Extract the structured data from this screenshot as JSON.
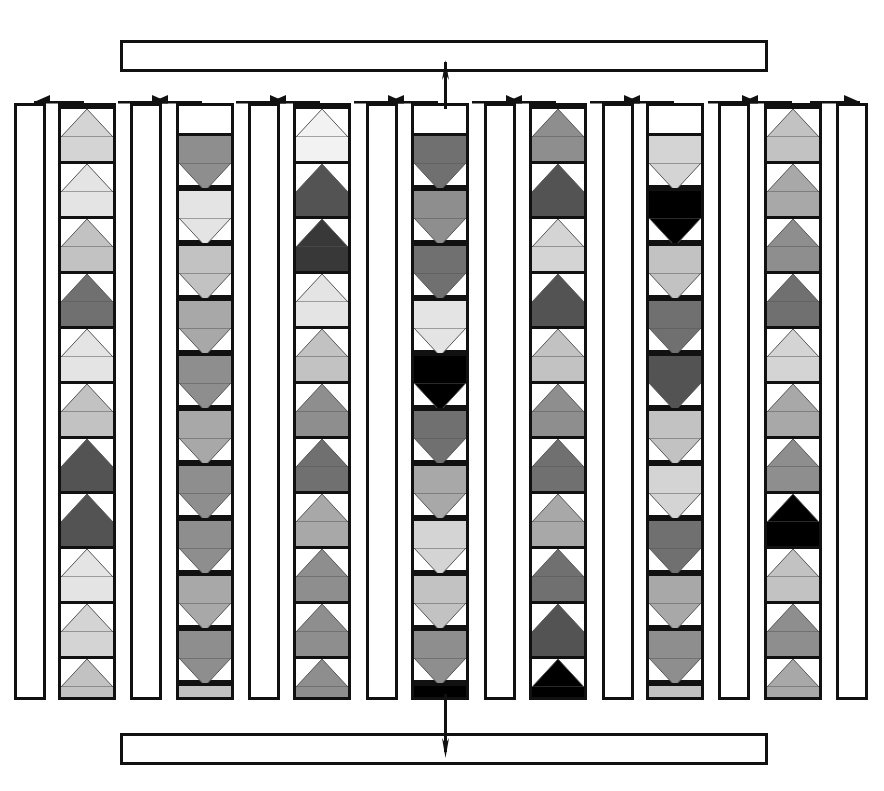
{
  "diagram": {
    "canvas": {
      "width": 884,
      "height": 791
    },
    "colors": {
      "stroke": "#111111",
      "background": "#ffffff",
      "grays": {
        "g1": "#f2f2f2",
        "g2": "#e4e4e4",
        "g3": "#d4d4d4",
        "g4": "#c2c2c2",
        "g5": "#a8a8a8",
        "g6": "#8e8e8e",
        "g7": "#707070",
        "g8": "#535353",
        "g9": "#383838",
        "g10": "#000000"
      }
    },
    "top_bus": {
      "label": "",
      "x": 120,
      "y": 40,
      "width": 648,
      "height": 32
    },
    "bottom_bus": {
      "label": "",
      "x": 120,
      "y": 733,
      "width": 648,
      "height": 32
    },
    "center_trunk": {
      "x": 444,
      "top_y": 62,
      "bottom_y": 752,
      "up_arrow": true,
      "down_arrow": true
    },
    "arrow_row": {
      "y": 92,
      "arrows": [
        {
          "x": 34,
          "width": 50,
          "direction": "left"
        },
        {
          "x": 118,
          "width": 50,
          "direction": "right"
        },
        {
          "x": 152,
          "width": 50,
          "direction": "left"
        },
        {
          "x": 236,
          "width": 50,
          "direction": "right"
        },
        {
          "x": 270,
          "width": 50,
          "direction": "left"
        },
        {
          "x": 354,
          "width": 50,
          "direction": "right"
        },
        {
          "x": 388,
          "width": 50,
          "direction": "left"
        },
        {
          "x": 472,
          "width": 50,
          "direction": "right"
        },
        {
          "x": 506,
          "width": 50,
          "direction": "left"
        },
        {
          "x": 590,
          "width": 50,
          "direction": "right"
        },
        {
          "x": 624,
          "width": 50,
          "direction": "left"
        },
        {
          "x": 708,
          "width": 50,
          "direction": "right"
        },
        {
          "x": 742,
          "width": 50,
          "direction": "left"
        },
        {
          "x": 810,
          "width": 50,
          "direction": "right"
        }
      ]
    },
    "spacer_columns": [
      {
        "index": 0,
        "x": 14,
        "y": 103,
        "width": 32,
        "height": 597
      },
      {
        "index": 1,
        "x": 130,
        "y": 103,
        "width": 32,
        "height": 597
      },
      {
        "index": 2,
        "x": 248,
        "y": 103,
        "width": 32,
        "height": 597
      },
      {
        "index": 3,
        "x": 366,
        "y": 103,
        "width": 32,
        "height": 597
      },
      {
        "index": 4,
        "x": 484,
        "y": 103,
        "width": 32,
        "height": 597
      },
      {
        "index": 5,
        "x": 602,
        "y": 103,
        "width": 32,
        "height": 597
      },
      {
        "index": 6,
        "x": 718,
        "y": 103,
        "width": 32,
        "height": 597
      },
      {
        "index": 7,
        "x": 836,
        "y": 103,
        "width": 32,
        "height": 597
      }
    ],
    "data_columns": [
      {
        "index": 0,
        "x": 58,
        "y": 103,
        "width": 58,
        "height": 597,
        "orientation": "up",
        "offset": 0,
        "cells": [
          "g3",
          "g2",
          "g4",
          "g7",
          "g2",
          "g4",
          "g8",
          "g8",
          "g2",
          "g3",
          "g4"
        ]
      },
      {
        "index": 1,
        "x": 176,
        "y": 103,
        "width": 58,
        "height": 597,
        "orientation": "down",
        "offset": 27,
        "cells": [
          "g6",
          "g2",
          "g4",
          "g5",
          "g6",
          "g5",
          "g6",
          "g6",
          "g5",
          "g6",
          "g4"
        ]
      },
      {
        "index": 2,
        "x": 293,
        "y": 103,
        "width": 58,
        "height": 597,
        "orientation": "up",
        "offset": 0,
        "cells": [
          "g1",
          "g8",
          "g9",
          "g2",
          "g4",
          "g6",
          "g7",
          "g5",
          "g6",
          "g6",
          "g6"
        ]
      },
      {
        "index": 3,
        "x": 411,
        "y": 103,
        "width": 58,
        "height": 597,
        "orientation": "down",
        "offset": 27,
        "cells": [
          "g7",
          "g6",
          "g7",
          "g2",
          "g10",
          "g7",
          "g5",
          "g3",
          "g4",
          "g6",
          "g10"
        ]
      },
      {
        "index": 4,
        "x": 529,
        "y": 103,
        "width": 58,
        "height": 597,
        "orientation": "up",
        "offset": 0,
        "cells": [
          "g6",
          "g8",
          "g3",
          "g8",
          "g4",
          "g6",
          "g7",
          "g5",
          "g7",
          "g8",
          "g10"
        ]
      },
      {
        "index": 5,
        "x": 646,
        "y": 103,
        "width": 58,
        "height": 597,
        "orientation": "down",
        "offset": 27,
        "cells": [
          "g3",
          "g10",
          "g4",
          "g7",
          "g8",
          "g4",
          "g3",
          "g7",
          "g5",
          "g6",
          "g4"
        ]
      },
      {
        "index": 6,
        "x": 764,
        "y": 103,
        "width": 58,
        "height": 597,
        "orientation": "up",
        "offset": 0,
        "cells": [
          "g4",
          "g5",
          "g6",
          "g7",
          "g3",
          "g5",
          "g6",
          "g10",
          "g4",
          "g6",
          "g5"
        ]
      }
    ],
    "cell_geometry": {
      "height": 55,
      "triangle_height": 28,
      "band_height": 27
    }
  }
}
